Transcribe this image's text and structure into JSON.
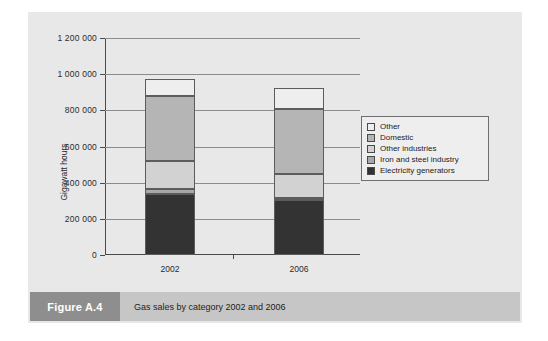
{
  "figure": {
    "tag_label": "Figure A.4",
    "caption": "Gas sales by category 2002 and 2006"
  },
  "colors": {
    "panel_background": "#e8e8e8",
    "caption_tag_background": "#8e8e8e",
    "caption_body_background": "#c6c6c6",
    "axis": "#4a4a4a",
    "gridline": "#8b8b8b",
    "series_other": "#eeeeee",
    "series_domestic": "#b5b5b5",
    "series_other_industries": "#d2d2d2",
    "series_iron_and_steel": "#a8a8a8",
    "series_electricity_generators": "#333333"
  },
  "chart_data": {
    "type": "bar",
    "stacked": true,
    "title": "Gas sales by category 2002 and 2006",
    "xlabel": "",
    "ylabel": "Gigawatt hours",
    "categories": [
      "2002",
      "2006"
    ],
    "ylim": [
      0,
      1200000
    ],
    "ytick_values": [
      0,
      200000,
      400000,
      600000,
      800000,
      1000000,
      1200000
    ],
    "ytick_labels": [
      "0",
      "200 000",
      "400 000",
      "600 000",
      "800 000",
      "1 000 000",
      "1 200 000"
    ],
    "grid": true,
    "legend_position": "right",
    "legend_order_top_to_bottom": [
      "Other",
      "Domestic",
      "Other industries",
      "Iron and steel industry",
      "Electricity generators"
    ],
    "series": [
      {
        "name": "Electricity generators",
        "color": "#333333",
        "values": [
          337000,
          304000
        ]
      },
      {
        "name": "Iron and steel industry",
        "color": "#a8a8a8",
        "values": [
          28000,
          11000
        ]
      },
      {
        "name": "Other industries",
        "color": "#d2d2d2",
        "values": [
          155000,
          133000
        ]
      },
      {
        "name": "Domestic",
        "color": "#b5b5b5",
        "values": [
          359000,
          359000
        ]
      },
      {
        "name": "Other",
        "color": "#eeeeee",
        "values": [
          94000,
          117000
        ]
      }
    ],
    "totals": [
      973000,
      924000
    ]
  }
}
